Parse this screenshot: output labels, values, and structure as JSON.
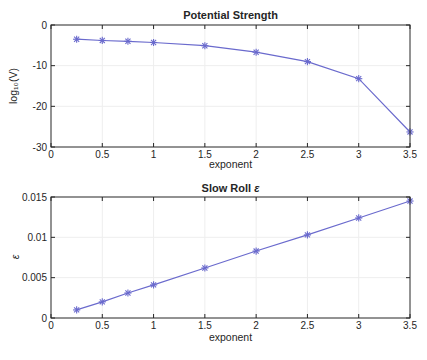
{
  "figure": {
    "background": "#ffffff",
    "line_color": "#6a6acd",
    "marker_color": "#6a6acd",
    "axis_color": "#262626",
    "grid_color": "#eeeeee",
    "text_color": "#262626"
  },
  "chart_data": [
    {
      "type": "line",
      "title": "Potential Strength",
      "title_italic_suffix": "",
      "xlabel": "exponent",
      "ylabel": "log₁₀(V)",
      "x": [
        0.25,
        0.5,
        0.75,
        1,
        1.5,
        2,
        2.5,
        3,
        3.5
      ],
      "y": [
        -3.5,
        -3.8,
        -4.0,
        -4.3,
        -5.1,
        -6.7,
        -9.0,
        -13.2,
        -26.3
      ],
      "xlim": [
        0,
        3.5
      ],
      "ylim": [
        -30,
        0
      ],
      "xtick_values": [
        0,
        0.5,
        1,
        1.5,
        2,
        2.5,
        3,
        3.5
      ],
      "xtick_labels": [
        "0",
        "0.5",
        "1",
        "1.5",
        "2",
        "2.5",
        "3",
        "3.5"
      ],
      "ytick_values": [
        0,
        -10,
        -20,
        -30
      ],
      "ytick_labels": [
        "0",
        "-10",
        "-20",
        "-30"
      ],
      "marker": "asterisk",
      "grid": true,
      "legend": null
    },
    {
      "type": "line",
      "title": "Slow Roll ",
      "title_italic_suffix": "ε",
      "xlabel": "exponent",
      "ylabel": "ε",
      "x": [
        0.25,
        0.5,
        0.75,
        1,
        1.5,
        2,
        2.5,
        3,
        3.5
      ],
      "y": [
        0.001,
        0.002,
        0.0031,
        0.0041,
        0.0062,
        0.0083,
        0.0103,
        0.0124,
        0.0145
      ],
      "xlim": [
        0,
        3.5
      ],
      "ylim": [
        0,
        0.015
      ],
      "xtick_values": [
        0,
        0.5,
        1,
        1.5,
        2,
        2.5,
        3,
        3.5
      ],
      "xtick_labels": [
        "0",
        "0.5",
        "1",
        "1.5",
        "2",
        "2.5",
        "3",
        "3.5"
      ],
      "ytick_values": [
        0,
        0.005,
        0.01,
        0.015
      ],
      "ytick_labels": [
        "0",
        "0.005",
        "0.01",
        "0.015"
      ],
      "marker": "asterisk",
      "grid": true,
      "legend": null
    }
  ]
}
